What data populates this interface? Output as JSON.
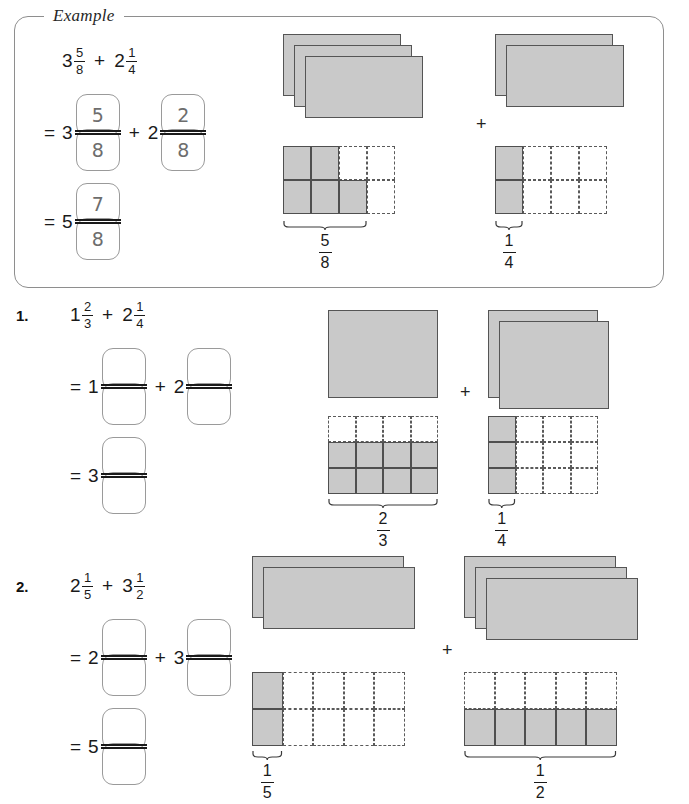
{
  "page": {
    "cutoff_text": "",
    "shade_color": "#c9c9c9",
    "outline_color": "#555555",
    "dash_color": "#5a5a5a"
  },
  "example": {
    "label": "Example",
    "expression": {
      "left_whole": "3",
      "left_num": "5",
      "left_den": "8",
      "operator": "+",
      "right_whole": "2",
      "right_num": "1",
      "right_den": "4"
    },
    "line1": {
      "equals": "=",
      "left_whole": "3",
      "left_num": "5",
      "left_den": "8",
      "plus": "+",
      "right_whole": "2",
      "right_num": "2",
      "right_den": "8"
    },
    "line2": {
      "equals": "=",
      "whole": "5",
      "num": "7",
      "den": "8"
    },
    "diagram": {
      "left": {
        "wholes": 3,
        "cols": 4,
        "rows": 2,
        "shaded_cells": [
          0,
          1,
          4,
          5,
          6
        ],
        "label_num": "5",
        "label_den": "8"
      },
      "operator": "+",
      "right": {
        "wholes": 2,
        "cols": 4,
        "rows": 2,
        "shaded_cells": [
          0,
          4
        ],
        "label_num": "1",
        "label_den": "4"
      }
    }
  },
  "problems": [
    {
      "number": "1.",
      "expression": {
        "left_whole": "1",
        "left_num": "2",
        "left_den": "3",
        "operator": "+",
        "right_whole": "2",
        "right_num": "1",
        "right_den": "4"
      },
      "line1": {
        "equals": "=",
        "left_whole": "1",
        "left_num": "",
        "left_den": "",
        "plus": "+",
        "right_whole": "2",
        "right_num": "",
        "right_den": ""
      },
      "line2": {
        "equals": "=",
        "whole": "3",
        "num": "",
        "den": ""
      },
      "diagram": {
        "left": {
          "wholes": 1,
          "cols": 4,
          "rows": 3,
          "shaded_cells": [
            4,
            5,
            6,
            7,
            8,
            9,
            10,
            11
          ],
          "label_num": "2",
          "label_den": "3"
        },
        "operator": "+",
        "right": {
          "wholes": 2,
          "cols": 4,
          "rows": 3,
          "shaded_cells": [
            0,
            4,
            8
          ],
          "label_num": "1",
          "label_den": "4"
        }
      }
    },
    {
      "number": "2.",
      "expression": {
        "left_whole": "2",
        "left_num": "1",
        "left_den": "5",
        "operator": "+",
        "right_whole": "3",
        "right_num": "1",
        "right_den": "2"
      },
      "line1": {
        "equals": "=",
        "left_whole": "2",
        "left_num": "",
        "left_den": "",
        "plus": "+",
        "right_whole": "3",
        "right_num": "",
        "right_den": ""
      },
      "line2": {
        "equals": "=",
        "whole": "5",
        "num": "",
        "den": ""
      },
      "diagram": {
        "left": {
          "wholes": 2,
          "cols": 5,
          "rows": 2,
          "shaded_cells": [
            0,
            5
          ],
          "label_num": "1",
          "label_den": "5"
        },
        "operator": "+",
        "right": {
          "wholes": 3,
          "cols": 5,
          "rows": 2,
          "shaded_cells": [
            5,
            6,
            7,
            8,
            9
          ],
          "label_num": "1",
          "label_den": "2"
        }
      }
    }
  ]
}
